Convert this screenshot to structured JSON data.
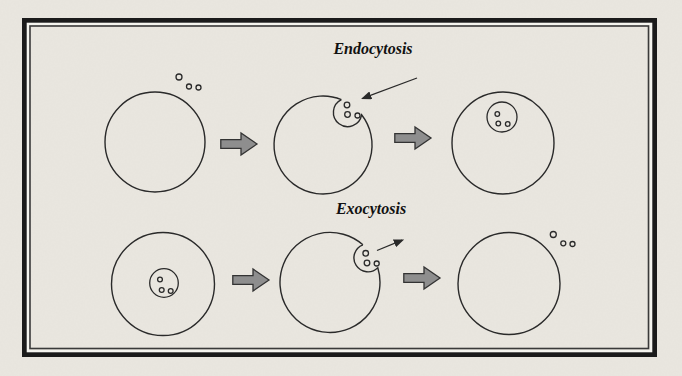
{
  "figure": {
    "labels": {
      "endocytosis": "Endocytosis",
      "exocytosis": "Exocytosis"
    },
    "colors": {
      "paper": "#eae7e0",
      "outline": "#2a2a2a",
      "arrow_fill": "#8e8e8e",
      "arrow_outline": "#333333",
      "frame": "#1b1b1b",
      "text": "#111111"
    },
    "rows": [
      {
        "label": "Endocytosis",
        "cell_count": 3
      },
      {
        "label": "Exocytosis",
        "cell_count": 3
      }
    ]
  }
}
